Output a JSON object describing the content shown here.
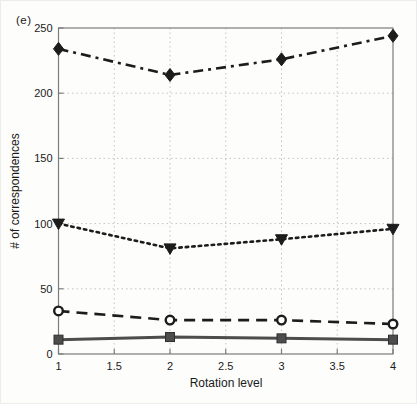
{
  "figure": {
    "panel_label": "(e)"
  },
  "chart_data": {
    "type": "line",
    "title": "",
    "xlabel": "Rotation level",
    "ylabel": "# of correspondences",
    "x": [
      1,
      2,
      3,
      4
    ],
    "xlim": [
      1,
      4
    ],
    "ylim": [
      0,
      250
    ],
    "x_ticks": [
      1,
      1.5,
      2,
      2.5,
      3,
      3.5,
      4
    ],
    "y_ticks": [
      0,
      50,
      100,
      150,
      200,
      250
    ],
    "grid": true,
    "grid_style": "dotted",
    "legend_position": "none",
    "axis_color": "#7c7c7c",
    "grid_color": "#c3c3c3",
    "text_color": "#1a1a1a",
    "series": [
      {
        "name": "diamond-dashdot",
        "marker": "diamond",
        "line_style": "dash-dot",
        "color": "#1c1c1c",
        "values": [
          234,
          214,
          226,
          244
        ]
      },
      {
        "name": "triangle-dotted",
        "marker": "triangle-down",
        "line_style": "dotted",
        "color": "#1c1c1c",
        "values": [
          100,
          81,
          88,
          96
        ]
      },
      {
        "name": "circle-dashed",
        "marker": "circle-open",
        "line_style": "dashed",
        "color": "#1c1c1c",
        "values": [
          33,
          26,
          26,
          23
        ]
      },
      {
        "name": "square-solid",
        "marker": "square",
        "line_style": "solid",
        "color": "#4d4d4d",
        "values": [
          11,
          13,
          12,
          11
        ]
      }
    ]
  }
}
